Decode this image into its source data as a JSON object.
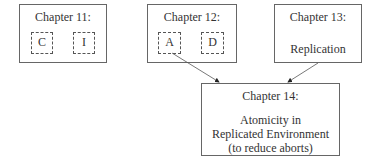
{
  "diagram": {
    "ch11": {
      "title": "Chapter 11:",
      "items": [
        "C",
        "I"
      ]
    },
    "ch12": {
      "title": "Chapter 12:",
      "items": [
        "A",
        "D"
      ]
    },
    "ch13": {
      "title": "Chapter 13:",
      "body": "Replication"
    },
    "ch14": {
      "title": "Chapter 14:",
      "body_lines": [
        "Atomicity in",
        "Replicated Environment",
        "(to reduce aborts)"
      ]
    },
    "edges": [
      {
        "from": "ch12.A",
        "to": "ch14"
      },
      {
        "from": "ch13",
        "to": "ch14"
      }
    ]
  }
}
